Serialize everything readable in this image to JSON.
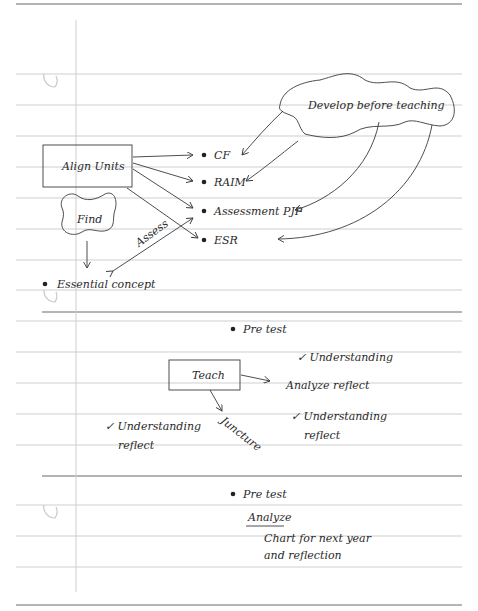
{
  "diagram": {
    "section_1": {
      "cloud_label": "Develop before teaching",
      "box_label": "Align Units",
      "find_label": "Find",
      "assess_label": "Assess",
      "bullets": [
        {
          "label": "CF"
        },
        {
          "label": "RAIM"
        },
        {
          "label": "Assessment PJP"
        },
        {
          "label": "ESR"
        }
      ],
      "essential_label": "Essential concept"
    },
    "section_2": {
      "bullet_label": "Pre test",
      "box_label": "Teach",
      "juncture_label": "Juncture",
      "check_1": "✓ Understanding",
      "analyze_reflect": "Analyze reflect",
      "check_2_line1": "✓ Understanding",
      "check_2_line2": "reflect",
      "check_left_line1": "✓ Understanding",
      "check_left_line2": "reflect"
    },
    "section_3": {
      "bullet_label": "Pre test",
      "analyze_label": "Analyze",
      "chart_line1": "Chart for next year",
      "chart_line2": "and reflection"
    }
  },
  "colors": {
    "ink": "#2a2a2a",
    "rule": "#cfcfcf",
    "rule_dark": "#6a6a6a"
  }
}
